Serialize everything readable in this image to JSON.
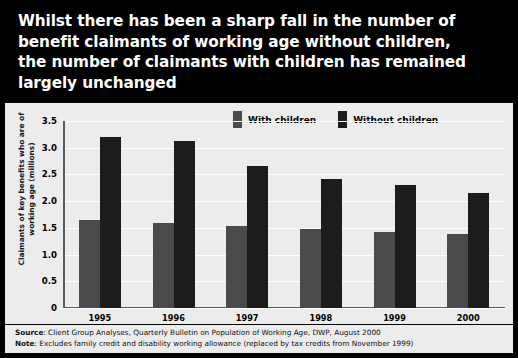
{
  "title": "Whilst there has been a sharp fall in the number of\nbenefit claimants of working age without children,\nthe number of claimants with children has remained\nlargely unchanged",
  "legend": {
    "items": [
      {
        "label": "With children",
        "color": "#4a4a4a",
        "swatch_icon": "legend-swatch-icon"
      },
      {
        "label": "Without children",
        "color": "#1c1c1c",
        "swatch_icon": "legend-swatch-icon"
      }
    ]
  },
  "footer": {
    "source_key": "Source",
    "source_text": ": Client Group Analyses, Quarterly Bulletin on Population of Working Age, DWP, August 2000",
    "note_key": "Note",
    "note_text": ": Excludes family credit and disability working allowance (replaced by tax credits from November 1999)"
  },
  "chart_data": {
    "type": "bar",
    "title": "Whilst there has been a sharp fall in the number of benefit claimants of working age without children, the number of claimants with children has remained largely unchanged",
    "xlabel": "",
    "ylabel": "Claimants of key benefits who are of\nworking age (millions)",
    "categories": [
      "1995",
      "1996",
      "1997",
      "1998",
      "1999",
      "2000"
    ],
    "series": [
      {
        "name": "With children",
        "color": "#4a4a4a",
        "values": [
          1.65,
          1.6,
          1.53,
          1.48,
          1.43,
          1.38
        ]
      },
      {
        "name": "Without children",
        "color": "#1c1c1c",
        "values": [
          3.2,
          3.12,
          2.65,
          2.42,
          2.3,
          2.15
        ]
      }
    ],
    "ylim": [
      0,
      3.5
    ],
    "yticks": [
      "0",
      "0.5",
      "1.0",
      "1.5",
      "2.0",
      "2.5",
      "3.0",
      "3.5"
    ],
    "ytick_values": [
      0,
      0.5,
      1.0,
      1.5,
      2.0,
      2.5,
      3.0,
      3.5
    ],
    "grid": true,
    "legend_position": "top-center"
  }
}
